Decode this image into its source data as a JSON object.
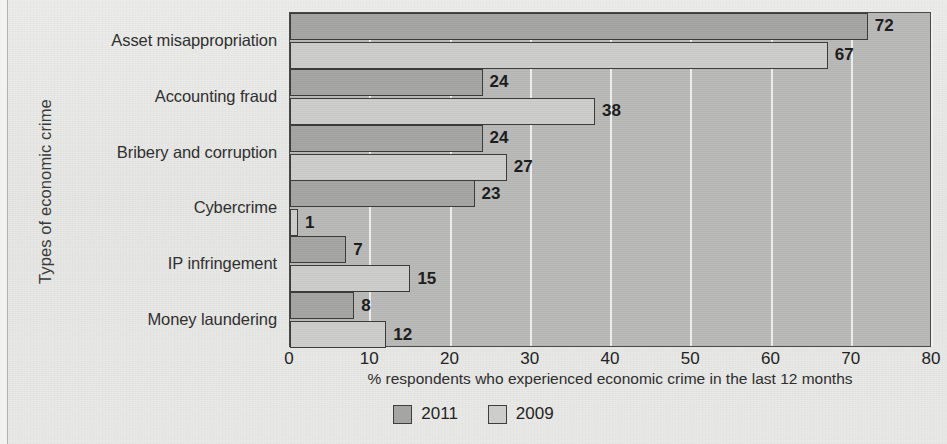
{
  "chart_data": {
    "type": "bar",
    "orientation": "horizontal",
    "title": "",
    "categories": [
      "Asset misappropriation",
      "Accounting fraud",
      "Bribery and corruption",
      "Cybercrime",
      "IP infringement",
      "Money laundering"
    ],
    "series": [
      {
        "name": "2011",
        "values": [
          72,
          24,
          24,
          23,
          7,
          8
        ],
        "color": "#a5a5a3"
      },
      {
        "name": "2009",
        "values": [
          67,
          38,
          27,
          1,
          15,
          12
        ],
        "color": "#cdcdcb"
      }
    ],
    "xlabel": "% respondents who experienced economic crime in the last 12 months",
    "ylabel": "Types of economic crime",
    "xlim": [
      0,
      80
    ],
    "xticks": [
      0,
      10,
      20,
      30,
      40,
      50,
      60,
      70,
      80
    ],
    "xtick_labels": [
      "0",
      "10",
      "20",
      "30",
      "40",
      "50",
      "60",
      "70",
      "80"
    ],
    "grid": true,
    "grid_axis": "x",
    "legend_position": "bottom",
    "data_labels": true,
    "plot_background": "#b9b9b7",
    "page_background": "#e8e8e6"
  },
  "legend": {
    "items": [
      {
        "label": "2011"
      },
      {
        "label": "2009"
      }
    ]
  }
}
